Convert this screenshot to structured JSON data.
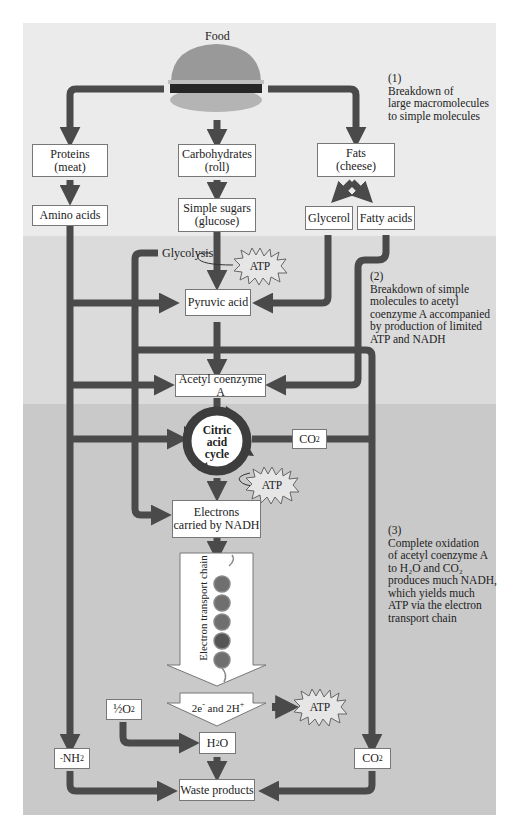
{
  "title": "Food",
  "colors": {
    "band_top": "#ebebeb",
    "band_middle": "#dbdbdb",
    "band_bottom": "#c9c9c9",
    "arrow": "#4a4a4a",
    "box_fill": "#ffffff"
  },
  "stages": [
    {
      "number": "(1)",
      "description": [
        "Breakdown of",
        "large macromolecules",
        "to simple molecules"
      ]
    },
    {
      "number": "(2)",
      "description": [
        "Breakdown of simple",
        "molecules to acetyl",
        "coenzyme A accompanied",
        "by production of limited",
        "ATP and NADH"
      ]
    },
    {
      "number": "(3)",
      "description": [
        "Complete oxidation",
        "of acetyl coenzyme A",
        "to H₂O and CO₂",
        "produces much NADH,",
        "which yields much",
        "ATP via the electron",
        "transport chain"
      ]
    }
  ],
  "macromolecules": [
    {
      "name": "Proteins",
      "source": "(meat)"
    },
    {
      "name": "Carbohydrates",
      "source": "(roll)"
    },
    {
      "name": "Fats",
      "source": "(cheese)"
    }
  ],
  "simple_molecules": {
    "amino_acids": "Amino acids",
    "simple_sugars": "Simple sugars",
    "simple_sugars_sub": "(glucose)",
    "glycerol": "Glycerol",
    "fatty_acids": "Fatty acids"
  },
  "glycolysis": "Glycolysis",
  "atp": "ATP",
  "pyruvic_acid": "Pyruvic acid",
  "acetyl_coa": "Acetyl coenzyme A",
  "citric_acid_cycle": [
    "Citric",
    "acid",
    "cycle"
  ],
  "co2": "CO",
  "co2_sub": "2",
  "electrons_nadh": [
    "Electrons",
    "carried by NADH"
  ],
  "electron_transport_chain": "Electron transport chain",
  "electrons_protons": {
    "a": "2e",
    "a_sup": "-",
    "b": " and 2H",
    "b_sup": "+"
  },
  "half_o2": "½O",
  "half_o2_sub": "2",
  "water": {
    "h": "H",
    "sub": "2",
    "o": "O"
  },
  "amine": {
    "text": "NH",
    "prefix": "-",
    "sub": "2"
  },
  "waste_products": "Waste products"
}
